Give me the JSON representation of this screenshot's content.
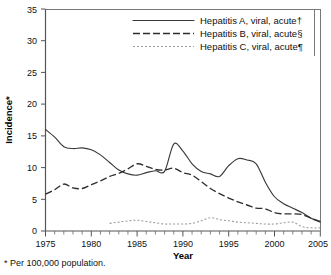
{
  "chart_data": {
    "type": "line",
    "title": "",
    "xlabel": "Year",
    "ylabel": "Incidence*",
    "xlim": [
      1975,
      2005
    ],
    "ylim": [
      0,
      35
    ],
    "grid": false,
    "legend_position": "top-right",
    "x_ticks": [
      1975,
      1980,
      1985,
      1990,
      1995,
      2000,
      2005
    ],
    "x_minor_tick_interval": 1,
    "y_ticks": [
      0,
      5,
      10,
      15,
      20,
      25,
      30,
      35
    ],
    "x": [
      1975,
      1976,
      1977,
      1978,
      1979,
      1980,
      1981,
      1982,
      1983,
      1984,
      1985,
      1986,
      1987,
      1988,
      1989,
      1990,
      1991,
      1992,
      1993,
      1994,
      1995,
      1996,
      1997,
      1998,
      1999,
      2000,
      2001,
      2002,
      2003,
      2004,
      2005
    ],
    "series": [
      {
        "name": "Hepatitis A, viral, acute†",
        "style": "solid",
        "color": "#3a3a3a",
        "values": [
          16.0,
          14.8,
          13.3,
          13.0,
          13.1,
          12.8,
          12.0,
          10.8,
          9.6,
          9.0,
          8.8,
          9.2,
          9.5,
          9.4,
          13.7,
          12.6,
          10.6,
          9.4,
          9.0,
          8.6,
          10.3,
          11.4,
          11.2,
          10.6,
          7.7,
          5.4,
          4.3,
          3.6,
          2.9,
          2.0,
          1.4
        ]
      },
      {
        "name": "Hepatitis B, viral, acute§",
        "style": "dashed",
        "color": "#2e2e2e",
        "values": [
          5.8,
          6.5,
          7.4,
          6.8,
          6.7,
          7.3,
          7.9,
          8.6,
          9.1,
          9.8,
          10.6,
          10.2,
          9.7,
          9.6,
          9.9,
          9.2,
          8.8,
          7.8,
          6.7,
          5.9,
          5.2,
          4.6,
          4.1,
          3.6,
          3.5,
          2.9,
          2.7,
          2.7,
          2.6,
          2.0,
          1.5
        ]
      },
      {
        "name": "Hepatitis C, viral, acute¶",
        "style": "dotted",
        "color": "#9a9a9a",
        "values": [
          null,
          null,
          null,
          null,
          null,
          null,
          null,
          1.2,
          1.4,
          1.6,
          1.7,
          1.5,
          1.3,
          1.1,
          1.1,
          1.1,
          1.2,
          1.6,
          2.1,
          1.8,
          1.6,
          1.4,
          1.3,
          1.2,
          1.1,
          1.1,
          1.3,
          1.4,
          0.7,
          0.5,
          0.5
        ]
      }
    ]
  },
  "axes": {
    "y_title": "Incidence*",
    "x_title": "Year",
    "x_tick_labels": [
      "1975",
      "1980",
      "1985",
      "1990",
      "1995",
      "2000",
      "2005"
    ],
    "y_tick_labels": [
      "0",
      "5",
      "10",
      "15",
      "20",
      "25",
      "30",
      "35"
    ]
  },
  "legend": {
    "items": [
      {
        "label": "Hepatitis A, viral, acute†",
        "style": "solid"
      },
      {
        "label": "Hepatitis B, viral, acute§",
        "style": "dashed"
      },
      {
        "label": "Hepatitis C, viral, acute¶",
        "style": "dotted"
      }
    ]
  },
  "footnote": "* Per 100,000 population."
}
